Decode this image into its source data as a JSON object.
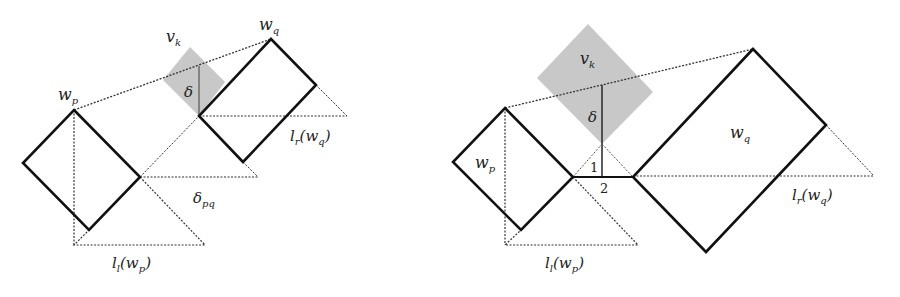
{
  "figure": {
    "left_panel": {
      "labels": {
        "wp": "w",
        "wp_sub": "p",
        "wq": "w",
        "wq_sub": "q",
        "vk": "v",
        "vk_sub": "k",
        "delta": "δ",
        "delta_pq": "δ",
        "delta_pq_sub": "pq",
        "lr_wq": "l",
        "lr_wq_sub": "r",
        "lr_wq_arg": "(w",
        "lr_wq_arg_sub": "q",
        "lr_wq_close": ")",
        "ll_wp": "l",
        "ll_wp_sub": "l",
        "ll_wp_arg": "(w",
        "ll_wp_arg_sub": "p",
        "ll_wp_close": ")"
      }
    },
    "right_panel": {
      "labels": {
        "wp": "w",
        "wp_sub": "p",
        "wq": "w",
        "wq_sub": "q",
        "vk": "v",
        "vk_sub": "k",
        "delta": "δ",
        "angle1": "1",
        "angle2": "2",
        "lr_wq": "l",
        "lr_wq_sub": "r",
        "lr_wq_arg": "(w",
        "lr_wq_arg_sub": "q",
        "lr_wq_close": ")",
        "ll_wp": "l",
        "ll_wp_sub": "l",
        "ll_wp_arg": "(w",
        "ll_wp_arg_sub": "p",
        "ll_wp_close": ")"
      }
    },
    "colors": {
      "stroke": "#111111",
      "shade": "#c8c8c8",
      "dotted": "#333333"
    }
  }
}
